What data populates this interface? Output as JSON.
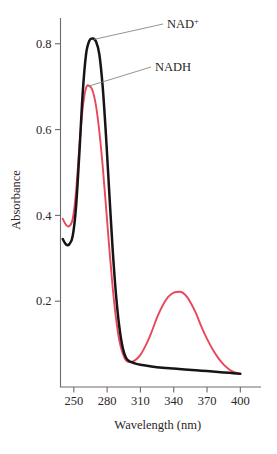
{
  "chart_data": {
    "type": "line",
    "title": "",
    "xlabel": "Wavelength (nm)",
    "ylabel": "Absorbance",
    "xlim": [
      238,
      406
    ],
    "ylim": [
      0.0,
      0.86
    ],
    "xticks": [
      250,
      280,
      310,
      340,
      370,
      400
    ],
    "xtick_labels": [
      "250",
      "280",
      "310",
      "340",
      "370",
      "400"
    ],
    "yticks": [
      0.2,
      0.4,
      0.6,
      0.8
    ],
    "ytick_labels": [
      "0.2",
      "0.4",
      "0.6",
      "0.8"
    ],
    "grid": false,
    "legend_position": "inline-annotation",
    "annotations": [
      {
        "text": "NAD",
        "superscript": "+",
        "series": "NAD+",
        "points_to_nm": 268,
        "points_to_absorbance": 0.81
      },
      {
        "text": "NADH",
        "superscript": "",
        "series": "NADH",
        "points_to_nm": 262,
        "points_to_absorbance": 0.7
      }
    ],
    "series": [
      {
        "name": "NAD+",
        "color": "#181314",
        "x": [
          240,
          243,
          246,
          249,
          252,
          255,
          258,
          261,
          264,
          267,
          270,
          273,
          276,
          279,
          282,
          285,
          288,
          291,
          294,
          297,
          300,
          305,
          310,
          320,
          330,
          340,
          350,
          360,
          370,
          380,
          390,
          400
        ],
        "y": [
          0.345,
          0.332,
          0.333,
          0.352,
          0.42,
          0.545,
          0.685,
          0.775,
          0.807,
          0.812,
          0.805,
          0.775,
          0.7,
          0.585,
          0.45,
          0.32,
          0.215,
          0.14,
          0.092,
          0.068,
          0.06,
          0.055,
          0.052,
          0.048,
          0.045,
          0.043,
          0.041,
          0.039,
          0.037,
          0.035,
          0.033,
          0.031
        ]
      },
      {
        "name": "NADH",
        "color": "#e8475c",
        "x": [
          240,
          243,
          246,
          249,
          252,
          255,
          258,
          261,
          264,
          267,
          270,
          273,
          276,
          279,
          282,
          285,
          288,
          291,
          294,
          297,
          300,
          305,
          310,
          315,
          320,
          325,
          330,
          335,
          340,
          345,
          348,
          352,
          356,
          360,
          365,
          370,
          375,
          380,
          385,
          390,
          395,
          400
        ],
        "y": [
          0.392,
          0.378,
          0.375,
          0.392,
          0.455,
          0.56,
          0.65,
          0.697,
          0.702,
          0.69,
          0.655,
          0.595,
          0.515,
          0.42,
          0.322,
          0.232,
          0.16,
          0.108,
          0.078,
          0.062,
          0.058,
          0.062,
          0.075,
          0.098,
          0.128,
          0.162,
          0.19,
          0.21,
          0.22,
          0.222,
          0.22,
          0.21,
          0.193,
          0.172,
          0.14,
          0.112,
          0.088,
          0.068,
          0.052,
          0.041,
          0.034,
          0.03
        ]
      }
    ]
  }
}
